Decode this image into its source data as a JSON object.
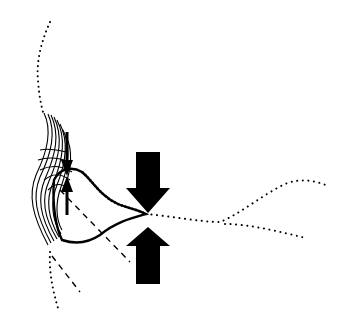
{
  "diagram": {
    "type": "anatomical-line-drawing",
    "background": "#ffffff",
    "ink": "#000000",
    "elements": {
      "compression_arrows": {
        "count": 2,
        "direction": [
          "down",
          "up"
        ],
        "color": "#000000"
      },
      "small_arrow": {
        "direction": "up",
        "color": "#000000"
      },
      "dotted_outlines": 3,
      "dashed_lines": 2,
      "hatched_tissue": true
    }
  }
}
